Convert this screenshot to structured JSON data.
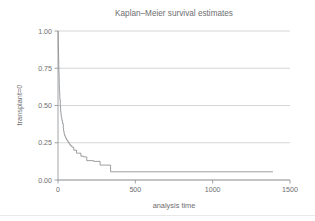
{
  "chart_data": {
    "type": "line",
    "subtype": "step-post",
    "title": "Kaplan–Meier survival estimates",
    "xlabel": "analysis time",
    "ylabel": "transplant=0",
    "xlim": [
      0,
      1500
    ],
    "ylim": [
      0,
      1
    ],
    "xticks": [
      0,
      500,
      1000,
      1500
    ],
    "xtick_labels": [
      "0",
      "500",
      "1000",
      "1500"
    ],
    "yticks": [
      0,
      0.25,
      0.5,
      0.75,
      1
    ],
    "ytick_labels": [
      "0.00",
      "0.25",
      "0.50",
      "0.75",
      "1.00"
    ],
    "grid": "horizontal",
    "legend": "none",
    "series": [
      {
        "name": "transplant=0",
        "color": "#8c8e91",
        "x": [
          0,
          1,
          2,
          3,
          4,
          5,
          6,
          7,
          8,
          9,
          11,
          12,
          15,
          16,
          17,
          19,
          21,
          25,
          29,
          34,
          36,
          39,
          42,
          46,
          50,
          55,
          61,
          68,
          73,
          80,
          90,
          102,
          120,
          148,
          165,
          186,
          230,
          272,
          285,
          308,
          340,
          1390
        ],
        "y": [
          1.0,
          0.96,
          0.9,
          0.85,
          0.8,
          0.76,
          0.72,
          0.68,
          0.64,
          0.6,
          0.57,
          0.54,
          0.5,
          0.48,
          0.46,
          0.44,
          0.42,
          0.4,
          0.38,
          0.35,
          0.33,
          0.31,
          0.3,
          0.29,
          0.28,
          0.27,
          0.26,
          0.25,
          0.24,
          0.23,
          0.22,
          0.2,
          0.18,
          0.16,
          0.155,
          0.13,
          0.125,
          0.1,
          0.1,
          0.1,
          0.055,
          0.055
        ],
        "final_value": 0.055,
        "end_time": 1390
      }
    ]
  }
}
